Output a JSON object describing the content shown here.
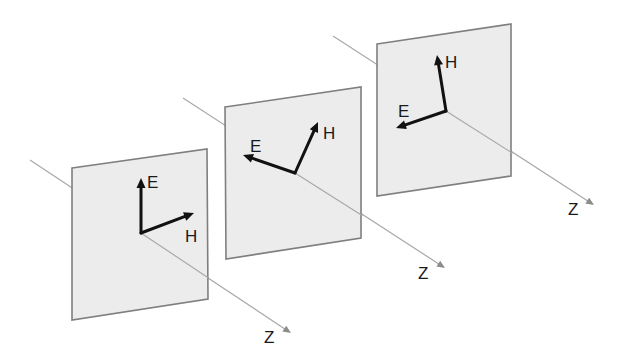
{
  "diagram": {
    "title": "",
    "colors": {
      "background": "#ffffff",
      "panel_fill": "#ececec",
      "panel_border": "#7f7f7f",
      "axis_line": "#a8a8a8",
      "vector": "#111111",
      "text": "#1a1a1a"
    },
    "planes": [
      {
        "id": "plane-1",
        "corners": [
          [
            72,
            168
          ],
          [
            207,
            149
          ],
          [
            208,
            299
          ],
          [
            72,
            320
          ]
        ],
        "axis": {
          "start": [
            30,
            160
          ],
          "end": [
            291,
            333
          ],
          "label": "Z",
          "label_pos": [
            264,
            343
          ]
        },
        "origin": [
          141,
          233
        ],
        "e_vector": {
          "tip": [
            141,
            178
          ],
          "label": "E",
          "label_pos": [
            147,
            188
          ]
        },
        "h_vector": {
          "tip": [
            194,
            213
          ],
          "label": "H",
          "label_pos": [
            185,
            242
          ]
        }
      },
      {
        "id": "plane-2",
        "corners": [
          [
            225,
            107
          ],
          [
            361,
            87
          ],
          [
            361,
            238
          ],
          [
            226,
            259
          ]
        ],
        "axis": {
          "start": [
            183,
            98
          ],
          "end": [
            445,
            268
          ],
          "label": "Z",
          "label_pos": [
            418,
            279
          ]
        },
        "origin": [
          295,
          173
        ],
        "e_vector": {
          "tip": [
            243,
            155
          ],
          "label": "E",
          "label_pos": [
            250,
            152
          ]
        },
        "h_vector": {
          "tip": [
            318,
            122
          ],
          "label": "H",
          "label_pos": [
            323,
            139
          ]
        }
      },
      {
        "id": "plane-3",
        "corners": [
          [
            377,
            44
          ],
          [
            511,
            24
          ],
          [
            511,
            176
          ],
          [
            377,
            196
          ]
        ],
        "axis": {
          "start": [
            333,
            36
          ],
          "end": [
            594,
            205
          ],
          "label": "Z",
          "label_pos": [
            568,
            215
          ]
        },
        "origin": [
          446,
          111
        ],
        "e_vector": {
          "tip": [
            396,
            128
          ],
          "label": "E",
          "label_pos": [
            398,
            117
          ]
        },
        "h_vector": {
          "tip": [
            437,
            55
          ],
          "label": "H",
          "label_pos": [
            445,
            68
          ]
        }
      }
    ]
  }
}
